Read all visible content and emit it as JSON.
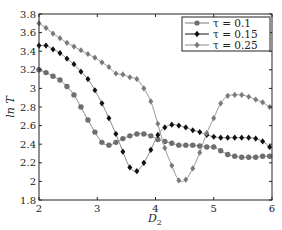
{
  "chart_data": {
    "type": "line",
    "title": "",
    "xlabel": "D_2",
    "ylabel": "ln T",
    "xlim": [
      2,
      6
    ],
    "ylim": [
      1.8,
      3.8
    ],
    "xticks": [
      2,
      3,
      4,
      5,
      6
    ],
    "yticks": [
      1.8,
      2,
      2.2,
      2.4,
      2.6,
      2.8,
      3,
      3.2,
      3.4,
      3.6,
      3.8
    ],
    "ytick_labels": [
      "1.8",
      "2",
      "2.2",
      "2.4",
      "2.6",
      "2.8",
      "3",
      "3.2",
      "3.4",
      "3.6",
      "3.8"
    ],
    "xtick_labels": [
      "2",
      "3",
      "4",
      "5",
      "6"
    ],
    "grid": false,
    "legend_position": "upper right",
    "x": [
      2.0,
      2.12,
      2.24,
      2.36,
      2.48,
      2.6,
      2.72,
      2.84,
      2.96,
      3.08,
      3.2,
      3.32,
      3.44,
      3.56,
      3.68,
      3.8,
      3.92,
      4.04,
      4.16,
      4.28,
      4.4,
      4.52,
      4.64,
      4.76,
      4.88,
      5.0,
      5.12,
      5.24,
      5.36,
      5.48,
      5.6,
      5.72,
      5.84,
      5.96
    ],
    "series": [
      {
        "name": "τ=0.1",
        "marker": "circle",
        "color": "#6e6e6e",
        "values": [
          3.2,
          3.17,
          3.13,
          3.09,
          3.02,
          2.93,
          2.8,
          2.66,
          2.53,
          2.42,
          2.39,
          2.42,
          2.46,
          2.49,
          2.51,
          2.51,
          2.49,
          2.45,
          2.43,
          2.41,
          2.39,
          2.39,
          2.39,
          2.38,
          2.37,
          2.37,
          2.33,
          2.29,
          2.27,
          2.26,
          2.26,
          2.26,
          2.27,
          2.27
        ]
      },
      {
        "name": "τ=0.15",
        "marker": "diamond",
        "color": "#111111",
        "values": [
          3.46,
          3.46,
          3.42,
          3.38,
          3.32,
          3.26,
          3.18,
          3.1,
          2.98,
          2.84,
          2.68,
          2.51,
          2.32,
          2.15,
          2.11,
          2.2,
          2.34,
          2.5,
          2.58,
          2.61,
          2.6,
          2.58,
          2.55,
          2.53,
          2.5,
          2.48,
          2.47,
          2.47,
          2.47,
          2.47,
          2.47,
          2.46,
          2.43,
          2.37
        ]
      },
      {
        "name": "τ=0.25",
        "marker": "diamond",
        "color": "#7a7a7a",
        "values": [
          3.7,
          3.65,
          3.59,
          3.54,
          3.49,
          3.45,
          3.41,
          3.37,
          3.33,
          3.28,
          3.23,
          3.16,
          3.15,
          3.12,
          3.1,
          3.0,
          2.86,
          2.62,
          2.36,
          2.17,
          2.01,
          2.02,
          2.14,
          2.31,
          2.52,
          2.68,
          2.84,
          2.92,
          2.93,
          2.93,
          2.91,
          2.88,
          2.85,
          2.8
        ]
      }
    ]
  },
  "legend": {
    "items": [
      {
        "label": "τ = 0.1"
      },
      {
        "label": "τ = 0.15"
      },
      {
        "label": "τ = 0.25"
      }
    ]
  },
  "axes": {
    "xlabel_main": "D",
    "xlabel_sub": "2",
    "ylabel": "ln T"
  }
}
